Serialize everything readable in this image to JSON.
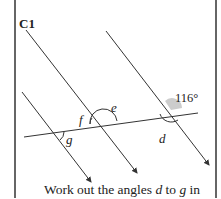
{
  "question": {
    "id": "C1",
    "given_angle": "116°",
    "angle_labels": {
      "d": "d",
      "e": "e",
      "f": "f",
      "g": "g"
    },
    "caption": {
      "part1": "Work out the angles ",
      "var1": "d",
      "part2": " to ",
      "var2": "g",
      "part3": " in"
    }
  },
  "colors": {
    "line": "#333333",
    "highlight": "#cccccc",
    "border": "#666666"
  }
}
